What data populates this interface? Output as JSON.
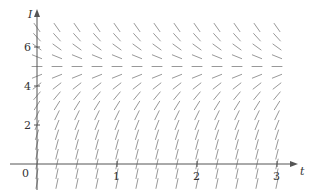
{
  "diagram": {
    "type": "slope_field",
    "x_axis": {
      "label": "t",
      "ticks": [
        1,
        2,
        3
      ],
      "origin_label": "0"
    },
    "y_axis": {
      "label": "I",
      "ticks": [
        2,
        4,
        6
      ]
    },
    "equilibrium": 5,
    "t_range": [
      0,
      3
    ],
    "t_step": 0.25,
    "I_range": [
      -1,
      7
    ],
    "I_step": 0.5,
    "colors": {
      "axis": "#555555",
      "segment": "#999999",
      "text": "#333333"
    }
  },
  "chart_data": {
    "type": "slope_field",
    "title": "",
    "xlabel": "t",
    "ylabel": "I",
    "x_ticks": [
      0,
      1,
      2,
      3
    ],
    "y_ticks": [
      2,
      4,
      6
    ],
    "xlim": [
      0,
      3.2
    ],
    "ylim": [
      -1,
      7.5
    ],
    "equilibrium_I": 5,
    "slope_angles_deg_by_I": {
      "-1": 78,
      "-0.5": 78,
      "0": 77,
      "0.5": 76,
      "1": 75,
      "1.5": 72,
      "2": 68,
      "2.5": 64,
      "3": 58,
      "3.5": 50,
      "4": 38,
      "4.5": 22,
      "5": 0,
      "5.5": -22,
      "6": -36,
      "6.5": -48,
      "7": -55
    }
  }
}
